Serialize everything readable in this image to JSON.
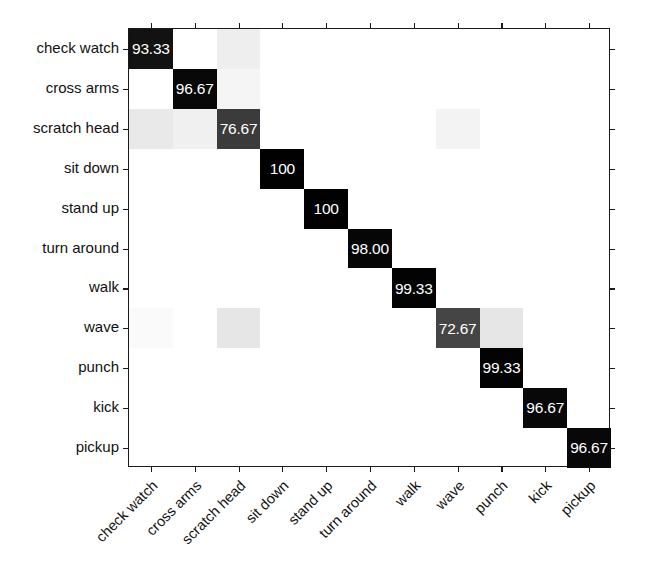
{
  "figure": {
    "type": "confusion-matrix",
    "title": "",
    "background_color": "#ffffff",
    "axis_color": "#1a1a1a",
    "text_color": "#111111",
    "cell_text_color": "#ffffff"
  },
  "chart_data": {
    "type": "heatmap",
    "title": "",
    "xlabel": "",
    "ylabel": "",
    "grid": false,
    "legend": "none",
    "colormap": "gray-inverted",
    "value_unit": "percent",
    "categories": [
      "check watch",
      "cross arms",
      "scratch head",
      "sit down",
      "stand up",
      "turn around",
      "walk",
      "wave",
      "punch",
      "kick",
      "pickup"
    ],
    "x_tick_labels": [
      "check watch",
      "cross arms",
      "scratch head",
      "sit down",
      "stand up",
      "turn around",
      "walk",
      "wave",
      "punch",
      "kick",
      "pickup"
    ],
    "y_tick_labels": [
      "check watch",
      "cross arms",
      "scratch head",
      "sit down",
      "stand up",
      "turn around",
      "walk",
      "wave",
      "punch",
      "kick",
      "pickup"
    ],
    "diagonal_values": [
      "93.33",
      "96.67",
      "76.67",
      "100",
      "100",
      "98.00",
      "99.33",
      "72.67",
      "99.33",
      "96.67",
      "96.67"
    ],
    "cells": [
      [
        {
          "value": "93.33",
          "shade": 0.93,
          "label": true
        },
        {
          "value": "",
          "shade": 0.0,
          "label": false
        },
        {
          "value": "",
          "shade": 0.07,
          "label": false
        },
        {
          "value": "",
          "shade": 0.0,
          "label": false
        },
        {
          "value": "",
          "shade": 0.0,
          "label": false
        },
        {
          "value": "",
          "shade": 0.0,
          "label": false
        },
        {
          "value": "",
          "shade": 0.0,
          "label": false
        },
        {
          "value": "",
          "shade": 0.0,
          "label": false
        },
        {
          "value": "",
          "shade": 0.0,
          "label": false
        },
        {
          "value": "",
          "shade": 0.0,
          "label": false
        },
        {
          "value": "",
          "shade": 0.0,
          "label": false
        }
      ],
      [
        {
          "value": "",
          "shade": 0.0,
          "label": false
        },
        {
          "value": "96.67",
          "shade": 0.97,
          "label": true
        },
        {
          "value": "",
          "shade": 0.04,
          "label": false
        },
        {
          "value": "",
          "shade": 0.0,
          "label": false
        },
        {
          "value": "",
          "shade": 0.0,
          "label": false
        },
        {
          "value": "",
          "shade": 0.0,
          "label": false
        },
        {
          "value": "",
          "shade": 0.0,
          "label": false
        },
        {
          "value": "",
          "shade": 0.0,
          "label": false
        },
        {
          "value": "",
          "shade": 0.0,
          "label": false
        },
        {
          "value": "",
          "shade": 0.0,
          "label": false
        },
        {
          "value": "",
          "shade": 0.0,
          "label": false
        }
      ],
      [
        {
          "value": "",
          "shade": 0.09,
          "label": false
        },
        {
          "value": "",
          "shade": 0.06,
          "label": false
        },
        {
          "value": "76.67",
          "shade": 0.77,
          "label": true
        },
        {
          "value": "",
          "shade": 0.0,
          "label": false
        },
        {
          "value": "",
          "shade": 0.0,
          "label": false
        },
        {
          "value": "",
          "shade": 0.0,
          "label": false
        },
        {
          "value": "",
          "shade": 0.0,
          "label": false
        },
        {
          "value": "",
          "shade": 0.05,
          "label": false
        },
        {
          "value": "",
          "shade": 0.0,
          "label": false
        },
        {
          "value": "",
          "shade": 0.0,
          "label": false
        },
        {
          "value": "",
          "shade": 0.0,
          "label": false
        }
      ],
      [
        {
          "value": "",
          "shade": 0.0,
          "label": false
        },
        {
          "value": "",
          "shade": 0.0,
          "label": false
        },
        {
          "value": "",
          "shade": 0.0,
          "label": false
        },
        {
          "value": "100",
          "shade": 1.0,
          "label": true
        },
        {
          "value": "",
          "shade": 0.0,
          "label": false
        },
        {
          "value": "",
          "shade": 0.0,
          "label": false
        },
        {
          "value": "",
          "shade": 0.0,
          "label": false
        },
        {
          "value": "",
          "shade": 0.0,
          "label": false
        },
        {
          "value": "",
          "shade": 0.0,
          "label": false
        },
        {
          "value": "",
          "shade": 0.0,
          "label": false
        },
        {
          "value": "",
          "shade": 0.0,
          "label": false
        }
      ],
      [
        {
          "value": "",
          "shade": 0.0,
          "label": false
        },
        {
          "value": "",
          "shade": 0.0,
          "label": false
        },
        {
          "value": "",
          "shade": 0.0,
          "label": false
        },
        {
          "value": "",
          "shade": 0.0,
          "label": false
        },
        {
          "value": "100",
          "shade": 1.0,
          "label": true
        },
        {
          "value": "",
          "shade": 0.0,
          "label": false
        },
        {
          "value": "",
          "shade": 0.0,
          "label": false
        },
        {
          "value": "",
          "shade": 0.0,
          "label": false
        },
        {
          "value": "",
          "shade": 0.0,
          "label": false
        },
        {
          "value": "",
          "shade": 0.0,
          "label": false
        },
        {
          "value": "",
          "shade": 0.0,
          "label": false
        }
      ],
      [
        {
          "value": "",
          "shade": 0.0,
          "label": false
        },
        {
          "value": "",
          "shade": 0.0,
          "label": false
        },
        {
          "value": "",
          "shade": 0.0,
          "label": false
        },
        {
          "value": "",
          "shade": 0.0,
          "label": false
        },
        {
          "value": "",
          "shade": 0.0,
          "label": false
        },
        {
          "value": "98.00",
          "shade": 0.98,
          "label": true
        },
        {
          "value": "",
          "shade": 0.0,
          "label": false
        },
        {
          "value": "",
          "shade": 0.0,
          "label": false
        },
        {
          "value": "",
          "shade": 0.0,
          "label": false
        },
        {
          "value": "",
          "shade": 0.0,
          "label": false
        },
        {
          "value": "",
          "shade": 0.0,
          "label": false
        }
      ],
      [
        {
          "value": "",
          "shade": 0.0,
          "label": false
        },
        {
          "value": "",
          "shade": 0.0,
          "label": false
        },
        {
          "value": "",
          "shade": 0.0,
          "label": false
        },
        {
          "value": "",
          "shade": 0.0,
          "label": false
        },
        {
          "value": "",
          "shade": 0.0,
          "label": false
        },
        {
          "value": "",
          "shade": 0.0,
          "label": false
        },
        {
          "value": "99.33",
          "shade": 0.99,
          "label": true
        },
        {
          "value": "",
          "shade": 0.0,
          "label": false
        },
        {
          "value": "",
          "shade": 0.0,
          "label": false
        },
        {
          "value": "",
          "shade": 0.0,
          "label": false
        },
        {
          "value": "",
          "shade": 0.0,
          "label": false
        }
      ],
      [
        {
          "value": "",
          "shade": 0.02,
          "label": false
        },
        {
          "value": "",
          "shade": 0.0,
          "label": false
        },
        {
          "value": "",
          "shade": 0.1,
          "label": false
        },
        {
          "value": "",
          "shade": 0.0,
          "label": false
        },
        {
          "value": "",
          "shade": 0.0,
          "label": false
        },
        {
          "value": "",
          "shade": 0.0,
          "label": false
        },
        {
          "value": "",
          "shade": 0.0,
          "label": false
        },
        {
          "value": "72.67",
          "shade": 0.73,
          "label": true
        },
        {
          "value": "",
          "shade": 0.1,
          "label": false
        },
        {
          "value": "",
          "shade": 0.0,
          "label": false
        },
        {
          "value": "",
          "shade": 0.0,
          "label": false
        }
      ],
      [
        {
          "value": "",
          "shade": 0.0,
          "label": false
        },
        {
          "value": "",
          "shade": 0.0,
          "label": false
        },
        {
          "value": "",
          "shade": 0.0,
          "label": false
        },
        {
          "value": "",
          "shade": 0.0,
          "label": false
        },
        {
          "value": "",
          "shade": 0.0,
          "label": false
        },
        {
          "value": "",
          "shade": 0.0,
          "label": false
        },
        {
          "value": "",
          "shade": 0.0,
          "label": false
        },
        {
          "value": "",
          "shade": 0.0,
          "label": false
        },
        {
          "value": "99.33",
          "shade": 0.99,
          "label": true
        },
        {
          "value": "",
          "shade": 0.0,
          "label": false
        },
        {
          "value": "",
          "shade": 0.0,
          "label": false
        }
      ],
      [
        {
          "value": "",
          "shade": 0.0,
          "label": false
        },
        {
          "value": "",
          "shade": 0.0,
          "label": false
        },
        {
          "value": "",
          "shade": 0.0,
          "label": false
        },
        {
          "value": "",
          "shade": 0.0,
          "label": false
        },
        {
          "value": "",
          "shade": 0.0,
          "label": false
        },
        {
          "value": "",
          "shade": 0.0,
          "label": false
        },
        {
          "value": "",
          "shade": 0.0,
          "label": false
        },
        {
          "value": "",
          "shade": 0.0,
          "label": false
        },
        {
          "value": "",
          "shade": 0.0,
          "label": false
        },
        {
          "value": "96.67",
          "shade": 0.97,
          "label": true
        },
        {
          "value": "",
          "shade": 0.0,
          "label": false
        }
      ],
      [
        {
          "value": "",
          "shade": 0.0,
          "label": false
        },
        {
          "value": "",
          "shade": 0.0,
          "label": false
        },
        {
          "value": "",
          "shade": 0.0,
          "label": false
        },
        {
          "value": "",
          "shade": 0.0,
          "label": false
        },
        {
          "value": "",
          "shade": 0.0,
          "label": false
        },
        {
          "value": "",
          "shade": 0.0,
          "label": false
        },
        {
          "value": "",
          "shade": 0.0,
          "label": false
        },
        {
          "value": "",
          "shade": 0.0,
          "label": false
        },
        {
          "value": "",
          "shade": 0.0,
          "label": false
        },
        {
          "value": "",
          "shade": 0.0,
          "label": false
        },
        {
          "value": "96.67",
          "shade": 0.97,
          "label": true
        }
      ]
    ]
  }
}
